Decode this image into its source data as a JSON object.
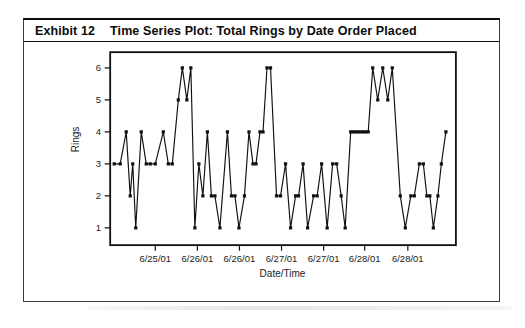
{
  "exhibit": {
    "label": "Exhibit 12",
    "title": "Time Series Plot: Total Rings by Date Order Placed"
  },
  "chart_data": {
    "type": "line",
    "title": "Time Series Plot: Total Rings by Date Order Placed",
    "xlabel": "Date/Time",
    "ylabel": "Rings",
    "ylim": [
      1,
      6
    ],
    "yticks": [
      1,
      2,
      3,
      4,
      5,
      6
    ],
    "grid": false,
    "legend": null,
    "marker": "square",
    "line_color": "#111111",
    "xticks": [
      {
        "t": 45,
        "label": "6/25/01"
      },
      {
        "t": 87,
        "label": "6/26/01"
      },
      {
        "t": 129,
        "label": "6/26/01"
      },
      {
        "t": 171,
        "label": "6/27/01"
      },
      {
        "t": 213,
        "label": "6/27/01"
      },
      {
        "t": 254,
        "label": "6/28/01"
      },
      {
        "t": 297,
        "label": "6/28/01"
      }
    ],
    "points": [
      {
        "t": 4,
        "rings": 3
      },
      {
        "t": 10,
        "rings": 3
      },
      {
        "t": 16,
        "rings": 4
      },
      {
        "t": 20,
        "rings": 2
      },
      {
        "t": 22.5,
        "rings": 3
      },
      {
        "t": 25.5,
        "rings": 1
      },
      {
        "t": 31,
        "rings": 4
      },
      {
        "t": 36,
        "rings": 3
      },
      {
        "t": 40,
        "rings": 3
      },
      {
        "t": 45,
        "rings": 3
      },
      {
        "t": 53,
        "rings": 4
      },
      {
        "t": 58,
        "rings": 3
      },
      {
        "t": 62,
        "rings": 3
      },
      {
        "t": 68,
        "rings": 5
      },
      {
        "t": 72,
        "rings": 6
      },
      {
        "t": 76.5,
        "rings": 5
      },
      {
        "t": 80.5,
        "rings": 6
      },
      {
        "t": 84.5,
        "rings": 1
      },
      {
        "t": 88.5,
        "rings": 3
      },
      {
        "t": 92.5,
        "rings": 2
      },
      {
        "t": 97,
        "rings": 4
      },
      {
        "t": 101,
        "rings": 2
      },
      {
        "t": 104.5,
        "rings": 2
      },
      {
        "t": 109.5,
        "rings": 1
      },
      {
        "t": 117,
        "rings": 4
      },
      {
        "t": 121,
        "rings": 2
      },
      {
        "t": 124.5,
        "rings": 2
      },
      {
        "t": 128.5,
        "rings": 1
      },
      {
        "t": 134,
        "rings": 2
      },
      {
        "t": 138.5,
        "rings": 4
      },
      {
        "t": 142.5,
        "rings": 3
      },
      {
        "t": 145.5,
        "rings": 3
      },
      {
        "t": 149.5,
        "rings": 4
      },
      {
        "t": 152.5,
        "rings": 4
      },
      {
        "t": 156.5,
        "rings": 6
      },
      {
        "t": 160,
        "rings": 6
      },
      {
        "t": 166,
        "rings": 2
      },
      {
        "t": 170,
        "rings": 2
      },
      {
        "t": 175,
        "rings": 3
      },
      {
        "t": 180,
        "rings": 1
      },
      {
        "t": 185,
        "rings": 2
      },
      {
        "t": 188,
        "rings": 2
      },
      {
        "t": 192.5,
        "rings": 3
      },
      {
        "t": 197,
        "rings": 1
      },
      {
        "t": 203,
        "rings": 2
      },
      {
        "t": 206.5,
        "rings": 2
      },
      {
        "t": 211,
        "rings": 3
      },
      {
        "t": 216.5,
        "rings": 1
      },
      {
        "t": 222,
        "rings": 3
      },
      {
        "t": 226,
        "rings": 3
      },
      {
        "t": 230.5,
        "rings": 2
      },
      {
        "t": 234.5,
        "rings": 1
      },
      {
        "t": 240,
        "rings": 4
      },
      {
        "t": 242.5,
        "rings": 4
      },
      {
        "t": 245,
        "rings": 4
      },
      {
        "t": 247.5,
        "rings": 4
      },
      {
        "t": 250,
        "rings": 4
      },
      {
        "t": 252.5,
        "rings": 4
      },
      {
        "t": 255,
        "rings": 4
      },
      {
        "t": 257.5,
        "rings": 4
      },
      {
        "t": 262,
        "rings": 6
      },
      {
        "t": 267,
        "rings": 5
      },
      {
        "t": 272,
        "rings": 6
      },
      {
        "t": 277,
        "rings": 5
      },
      {
        "t": 281.5,
        "rings": 6
      },
      {
        "t": 289.5,
        "rings": 2
      },
      {
        "t": 294.5,
        "rings": 1
      },
      {
        "t": 300,
        "rings": 2
      },
      {
        "t": 303.5,
        "rings": 2
      },
      {
        "t": 308.5,
        "rings": 3
      },
      {
        "t": 312.5,
        "rings": 3
      },
      {
        "t": 316,
        "rings": 2
      },
      {
        "t": 319,
        "rings": 2
      },
      {
        "t": 322.5,
        "rings": 1
      },
      {
        "t": 327,
        "rings": 2
      },
      {
        "t": 330.5,
        "rings": 3
      },
      {
        "t": 335,
        "rings": 4
      }
    ]
  }
}
